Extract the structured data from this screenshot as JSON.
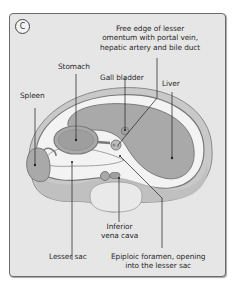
{
  "figure": {
    "panel_letter": "C",
    "labels": {
      "free_edge": [
        "Free edge of lesser",
        "omentum with portal vein,",
        "hepatic artery and bile duct"
      ],
      "stomach": "Stomach",
      "gall_bladder": "Gall bladder",
      "spleen": "Spleen",
      "liver": "Liver",
      "inferior_vena_cava": [
        "Inferior",
        "vena cava"
      ],
      "lesser_sac": "Lesser sac",
      "epiploic_foramen": [
        "Epiploic foramen, opening",
        "into the lesser sac"
      ]
    },
    "colors": {
      "panel_bg": "#e6e6e6",
      "organ_fill": "#a9a9a9",
      "organ_stroke": "#7a7a7a",
      "peritoneum": "#f3f3f3",
      "body_wall": "#c9c9c9",
      "leader_line": "#333333"
    }
  }
}
